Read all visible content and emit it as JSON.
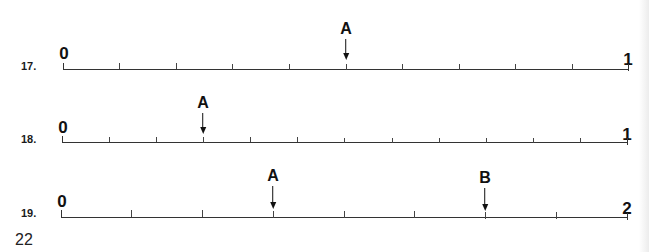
{
  "page": {
    "number": "22"
  },
  "problems": [
    {
      "label": "17.",
      "start": "0",
      "end": "1",
      "intervals": 10,
      "markers": [
        {
          "label": "A",
          "tick_index": 5,
          "value": "1/2"
        }
      ]
    },
    {
      "label": "18.",
      "start": "0",
      "end": "1",
      "intervals": 12,
      "markers": [
        {
          "label": "A",
          "tick_index": 3,
          "value": "1/4"
        }
      ]
    },
    {
      "label": "19.",
      "start": "0",
      "end": "2",
      "intervals": 8,
      "markers": [
        {
          "label": "A",
          "tick_index": 3,
          "value": "3/4"
        },
        {
          "label": "B",
          "tick_index": 6,
          "value": "1 1/2"
        }
      ]
    }
  ]
}
